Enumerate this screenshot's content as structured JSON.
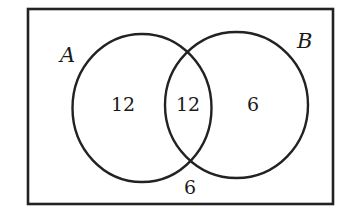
{
  "diagram": {
    "type": "venn",
    "universe": {
      "label": ""
    },
    "sets": [
      {
        "id": "A",
        "label": "A"
      },
      {
        "id": "B",
        "label": "B"
      }
    ],
    "regions": {
      "only_a": "12",
      "a_and_b": "12",
      "only_b": "6",
      "neither": "6"
    },
    "colors": {
      "stroke": "#222222",
      "text": "#1a1a1a",
      "background": "#ffffff"
    }
  }
}
